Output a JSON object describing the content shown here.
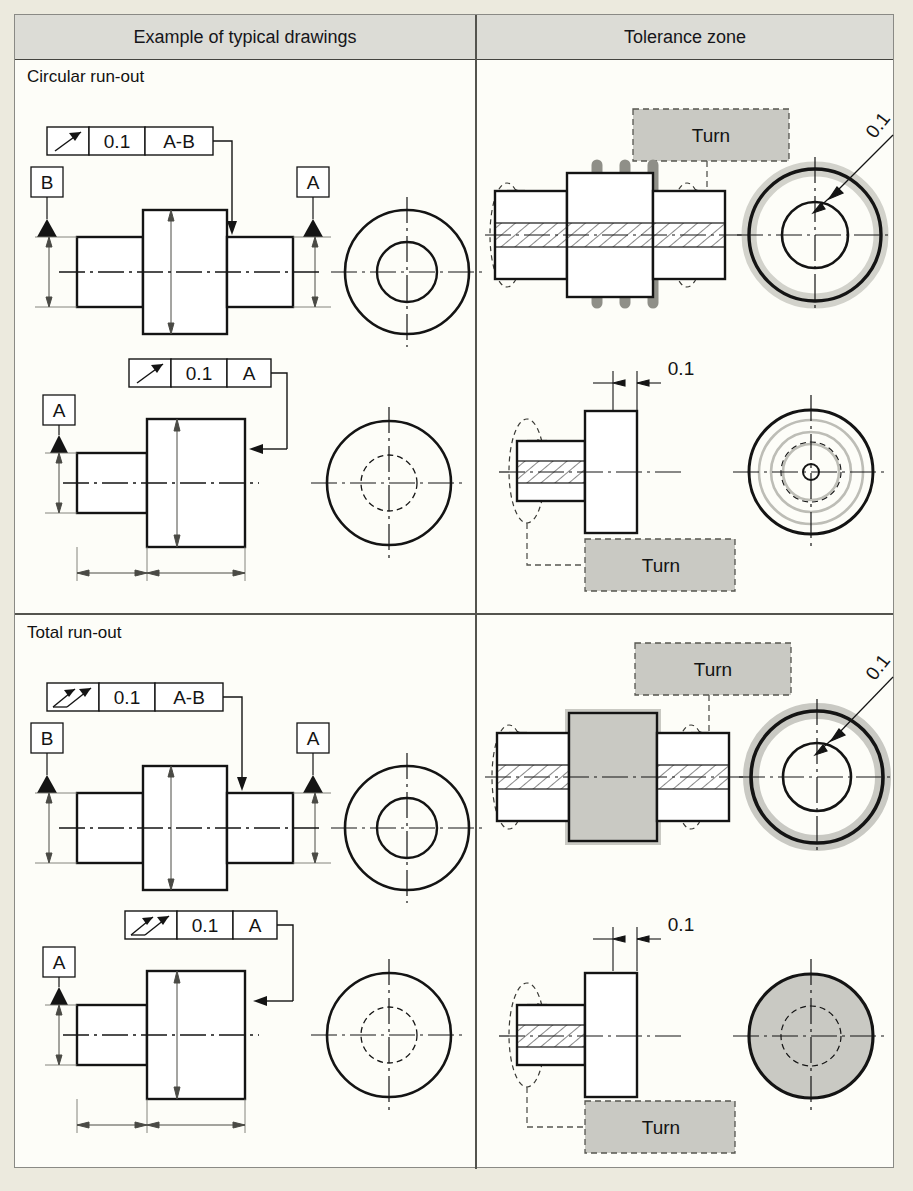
{
  "table": {
    "headers": {
      "left": "Example of typical drawings",
      "right": "Tolerance zone"
    },
    "sections": [
      {
        "label": "Circular run-out",
        "symbol": "single-arrow",
        "rows": [
          {
            "name": "radial-circular-runout",
            "frame": {
              "tolerance": "0.1",
              "datum": "A-B"
            },
            "datums": [
              "B",
              "A"
            ],
            "zone": {
              "callout": "0.1",
              "turn_label": "Turn",
              "zone_style": "discrete-bands"
            }
          },
          {
            "name": "axial-circular-runout",
            "frame": {
              "tolerance": "0.1",
              "datum": "A"
            },
            "datums": [
              "A"
            ],
            "zone": {
              "callout": "0.1",
              "turn_label": "Turn",
              "zone_style": "concentric-rings"
            }
          }
        ]
      },
      {
        "label": "Total run-out",
        "symbol": "double-arrow",
        "rows": [
          {
            "name": "radial-total-runout",
            "frame": {
              "tolerance": "0.1",
              "datum": "A-B"
            },
            "datums": [
              "B",
              "A"
            ],
            "zone": {
              "callout": "0.1",
              "turn_label": "Turn",
              "zone_style": "full-surface"
            }
          },
          {
            "name": "axial-total-runout",
            "frame": {
              "tolerance": "0.1",
              "datum": "A"
            },
            "datums": [
              "A"
            ],
            "zone": {
              "callout": "0.1",
              "turn_label": "Turn",
              "zone_style": "full-face"
            }
          }
        ]
      }
    ]
  },
  "colors": {
    "paper": "#eceade",
    "sheet": "#fdfdf8",
    "header_fill": "#dcdcd6",
    "ink": "#141414",
    "rule": "#54544e",
    "zone_grey": "#c9c9c3",
    "band_grey": "#8f8f88",
    "halo_grey": "#d2d2cb",
    "thin": "#6d6d66"
  }
}
